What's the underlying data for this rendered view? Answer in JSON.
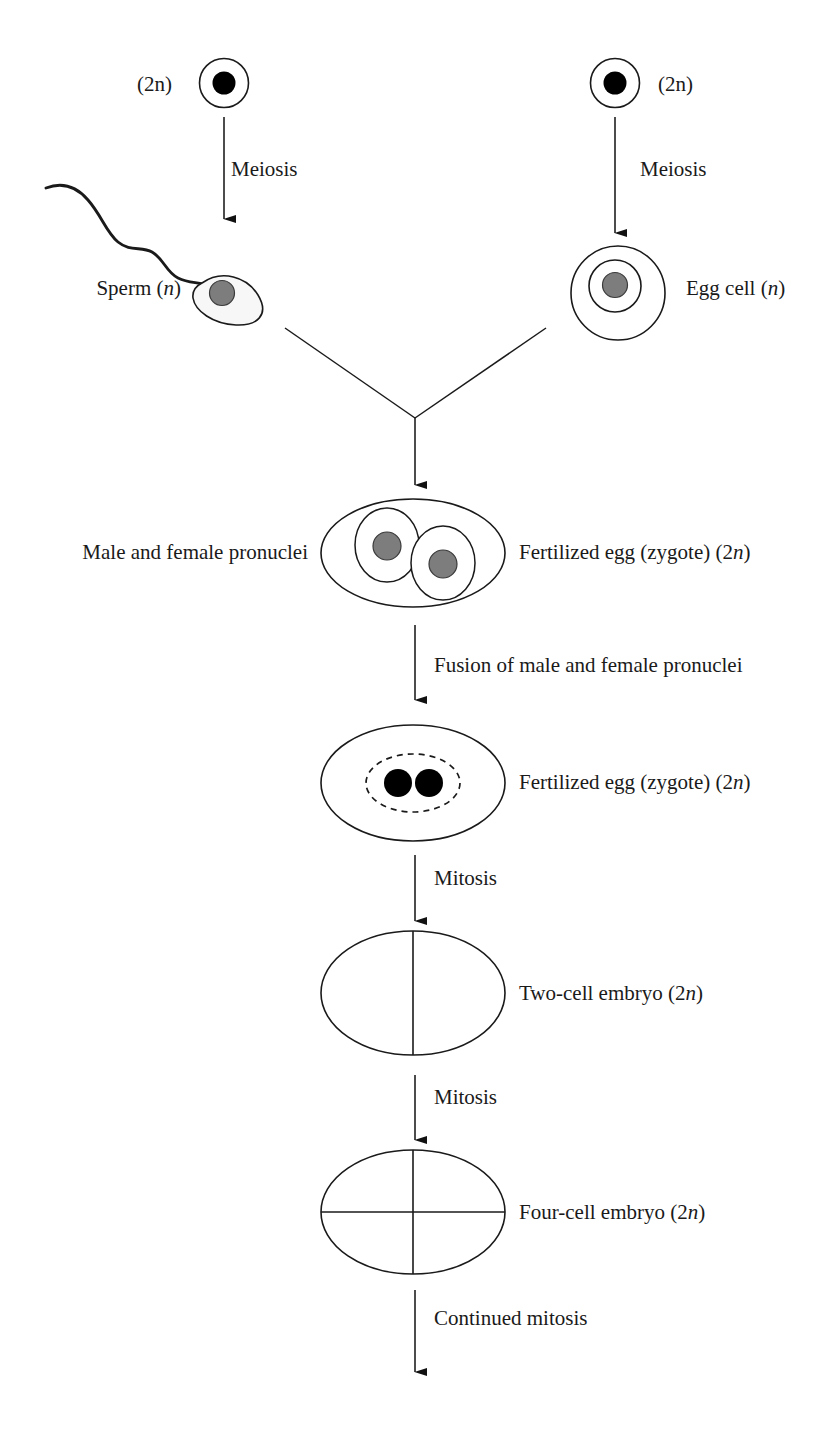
{
  "diagram": {
    "stroke_color": "#1a1a1a",
    "nucleus_gray": "#7d7d7d",
    "nucleus_black": "#000000",
    "cell_fill": "#ffffff",
    "sperm_fill": "#f7f7f7"
  },
  "labels": {
    "parent_left_ploidy": "(2n)",
    "parent_right_ploidy": "(2n)",
    "meiosis_left": "Meiosis",
    "meiosis_right": "Meiosis",
    "sperm": "Sperm (n)",
    "sperm_text": "Sperm",
    "sperm_ploidy": "n",
    "egg": "Egg cell (n)",
    "egg_text": "Egg cell",
    "egg_ploidy": "n",
    "pronuclei": "Male and female pronuclei",
    "zygote_1": "Fertilized egg (zygote) (2n)",
    "zygote_1_text": "Fertilized egg (zygote) (2",
    "fusion": "Fusion of male and female pronuclei",
    "zygote_2": "Fertilized egg (zygote) (2n)",
    "mitosis_1": "Mitosis",
    "two_cell": "Two-cell embryo (2n)",
    "two_cell_text": "Two-cell embryo (2",
    "mitosis_2": "Mitosis",
    "four_cell": "Four-cell embryo (2n)",
    "four_cell_text": "Four-cell embryo (2",
    "continued_mitosis": "Continued mitosis",
    "ploidy_n": "n",
    "ploidy_close": ")"
  },
  "stages": [
    {
      "id": "parent-cell-left",
      "name": "Diploid parent cell (male)",
      "ploidy": "2n"
    },
    {
      "id": "parent-cell-right",
      "name": "Diploid parent cell (female)",
      "ploidy": "2n"
    },
    {
      "id": "sperm-cell",
      "name": "Sperm",
      "ploidy": "n"
    },
    {
      "id": "egg-cell",
      "name": "Egg cell",
      "ploidy": "n"
    },
    {
      "id": "zygote-pronuclei",
      "name": "Fertilized egg (zygote)",
      "ploidy": "2n"
    },
    {
      "id": "zygote-fused",
      "name": "Fertilized egg (zygote)",
      "ploidy": "2n"
    },
    {
      "id": "two-cell-embryo",
      "name": "Two-cell embryo",
      "ploidy": "2n"
    },
    {
      "id": "four-cell-embryo",
      "name": "Four-cell embryo",
      "ploidy": "2n"
    }
  ],
  "transitions": [
    {
      "id": "meiosis-left",
      "label": "Meiosis"
    },
    {
      "id": "meiosis-right",
      "label": "Meiosis"
    },
    {
      "id": "fertilization",
      "label": ""
    },
    {
      "id": "pronuclei-fusion",
      "label": "Fusion of male and female pronuclei"
    },
    {
      "id": "mitosis-first",
      "label": "Mitosis"
    },
    {
      "id": "mitosis-second",
      "label": "Mitosis"
    },
    {
      "id": "mitosis-continued",
      "label": "Continued mitosis"
    }
  ]
}
